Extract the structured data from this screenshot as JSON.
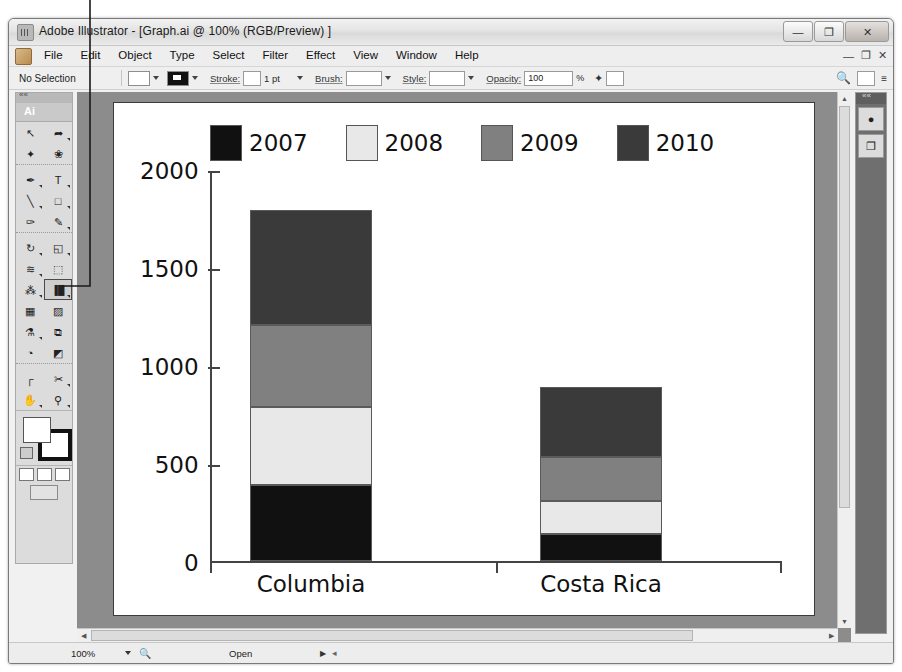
{
  "window": {
    "title": "Adobe Illustrator - [Graph.ai @ 100% (RGB/Preview) ]",
    "app_icon": "illustrator-icon",
    "minimize_label": "—",
    "maximize_label": "❐",
    "close_label": "✕"
  },
  "menubar": {
    "items": [
      "File",
      "Edit",
      "Object",
      "Type",
      "Select",
      "Filter",
      "Effect",
      "View",
      "Window",
      "Help"
    ],
    "doc_minimize": "—",
    "doc_restore": "❐",
    "doc_close": "✕"
  },
  "controlbar": {
    "selection_status": "No Selection",
    "stroke_label": "Stroke:",
    "stroke_value": "1 pt",
    "brush_label": "Brush:",
    "style_label": "Style:",
    "opacity_label": "Opacity:",
    "opacity_value": "100",
    "percent_symbol": "%"
  },
  "tools": {
    "panel_label": "Ai",
    "items": [
      {
        "name": "selection-tool",
        "glyph": "↖"
      },
      {
        "name": "direct-selection-tool",
        "glyph": "➦"
      },
      {
        "name": "magic-wand-tool",
        "glyph": "✦"
      },
      {
        "name": "lasso-tool",
        "glyph": "❀"
      },
      {
        "name": "pen-tool",
        "glyph": "✒"
      },
      {
        "name": "type-tool",
        "glyph": "T"
      },
      {
        "name": "line-segment-tool",
        "glyph": "╲"
      },
      {
        "name": "rectangle-tool",
        "glyph": "□"
      },
      {
        "name": "paintbrush-tool",
        "glyph": "✑"
      },
      {
        "name": "pencil-tool",
        "glyph": "✎"
      },
      {
        "name": "rotate-tool",
        "glyph": "↻"
      },
      {
        "name": "scale-tool",
        "glyph": "◱"
      },
      {
        "name": "warp-tool",
        "glyph": "≋"
      },
      {
        "name": "free-transform-tool",
        "glyph": "⬚"
      },
      {
        "name": "symbol-sprayer-tool",
        "glyph": "⁂"
      },
      {
        "name": "graph-tool",
        "glyph": "▐█"
      },
      {
        "name": "mesh-tool",
        "glyph": "▦"
      },
      {
        "name": "gradient-tool",
        "glyph": "▨"
      },
      {
        "name": "eyedropper-tool",
        "glyph": "⚗"
      },
      {
        "name": "blend-tool",
        "glyph": "⧉"
      },
      {
        "name": "live-paint-bucket-tool",
        "glyph": "◔"
      },
      {
        "name": "live-paint-selection-tool",
        "glyph": "◩"
      },
      {
        "name": "artboard-tool",
        "glyph": "┌"
      },
      {
        "name": "slice-tool",
        "glyph": "✂"
      },
      {
        "name": "hand-tool",
        "glyph": "✋"
      },
      {
        "name": "zoom-tool",
        "glyph": "⚲"
      }
    ],
    "selected": "graph-tool"
  },
  "dock": {
    "buttons": [
      {
        "name": "color-panel-icon",
        "glyph": "●"
      },
      {
        "name": "layers-panel-icon",
        "glyph": "❐"
      }
    ]
  },
  "statusbar": {
    "zoom": "100%",
    "zoom_tool_icon": "magnifier-icon",
    "status": "Open",
    "nav_glyph": "▶",
    "extra": "◂"
  },
  "chart_data": {
    "type": "bar",
    "subtype": "stacked",
    "title": "",
    "xlabel": "",
    "ylabel": "",
    "categories": [
      "Columbia",
      "Costa Rica"
    ],
    "ylim": [
      0,
      2000
    ],
    "yticks": [
      0,
      500,
      1000,
      1500,
      2000
    ],
    "ytick_labels": [
      "0",
      "500",
      "1000",
      "1500",
      "2000"
    ],
    "grid": false,
    "legend_position": "top",
    "series": [
      {
        "name": "2007",
        "color": "#111111",
        "values": [
          390,
          140
        ]
      },
      {
        "name": "2008",
        "color": "#e8e8e8",
        "values": [
          400,
          170
        ]
      },
      {
        "name": "2009",
        "color": "#808080",
        "values": [
          420,
          225
        ]
      },
      {
        "name": "2010",
        "color": "#3a3a3a",
        "values": [
          590,
          355
        ]
      }
    ],
    "totals": [
      1800,
      890
    ]
  }
}
